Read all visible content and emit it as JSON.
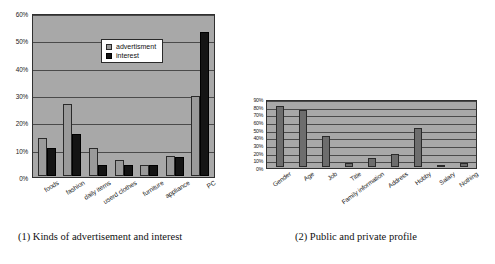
{
  "figures": [
    {
      "caption": "(1)  Kinds of advertisement and interest",
      "legend": [
        "advertisment",
        "interest"
      ]
    },
    {
      "caption": "(2)  Public and private profile"
    }
  ],
  "chart_data": [
    {
      "type": "bar",
      "title": "(1) Kinds of advertisement and interest",
      "xlabel": "",
      "ylabel": "",
      "ylim": [
        0,
        60
      ],
      "grid": true,
      "legend_position": "top-left",
      "yticks": [
        "0%",
        "10%",
        "20%",
        "30%",
        "40%",
        "50%",
        "60%"
      ],
      "categories": [
        "foods",
        "fashion",
        "daily items",
        "userd clothes",
        "furniture",
        "appliance",
        "PC"
      ],
      "series": [
        {
          "name": "advertisment",
          "color": "#9a9a9a",
          "values": [
            14,
            26.5,
            10.5,
            6,
            4,
            7.5,
            29.5
          ]
        },
        {
          "name": "interest",
          "color": "#141414",
          "values": [
            10.5,
            15.5,
            4,
            4,
            4,
            7,
            53.5
          ]
        }
      ]
    },
    {
      "type": "bar",
      "title": "(2) Public and private profile",
      "xlabel": "",
      "ylabel": "",
      "ylim": [
        0,
        90
      ],
      "grid": true,
      "yticks": [
        "0%",
        "10%",
        "20%",
        "30%",
        "40%",
        "50%",
        "60%",
        "70%",
        "80%",
        "90%"
      ],
      "categories": [
        "Gender",
        "Age",
        "Job",
        "Title",
        "Family information",
        "Address",
        "Hobby",
        "Salary",
        "Nothing"
      ],
      "series": [
        {
          "name": "public",
          "color": "#6d6d6d",
          "values": [
            82,
            77,
            42,
            5,
            12,
            18,
            52,
            3,
            6
          ]
        }
      ]
    }
  ]
}
